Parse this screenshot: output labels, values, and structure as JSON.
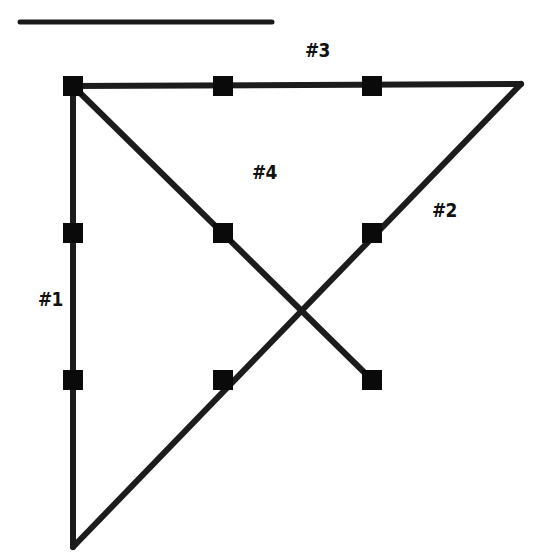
{
  "diagram": {
    "type": "nine-dot-puzzle-solution",
    "header": {
      "partial_title_visible": true,
      "rule": {
        "x1": 20,
        "y1": 22,
        "x2": 272,
        "y2": 22,
        "color": "#1a1a1a",
        "width": 5
      }
    },
    "dot_color": "#0a0a0a",
    "dot_size": 20,
    "line_color": "#1c1c1c",
    "line_width": 6,
    "dots": [
      {
        "id": "r1c1",
        "x": 73,
        "y": 86
      },
      {
        "id": "r1c2",
        "x": 223,
        "y": 86
      },
      {
        "id": "r1c3",
        "x": 372,
        "y": 86
      },
      {
        "id": "r2c1",
        "x": 73,
        "y": 233
      },
      {
        "id": "r2c2",
        "x": 223,
        "y": 233
      },
      {
        "id": "r2c3",
        "x": 372,
        "y": 233
      },
      {
        "id": "r3c1",
        "x": 73,
        "y": 380
      },
      {
        "id": "r3c2",
        "x": 223,
        "y": 380
      },
      {
        "id": "r3c3",
        "x": 372,
        "y": 380
      }
    ],
    "lines": [
      {
        "id": "line-1",
        "label": "#1",
        "x1": 73,
        "y1": 86,
        "x2": 73,
        "y2": 547
      },
      {
        "id": "line-2",
        "label": "#2",
        "x1": 73,
        "y1": 547,
        "x2": 521,
        "y2": 84
      },
      {
        "id": "line-3",
        "label": "#3",
        "x1": 521,
        "y1": 84,
        "x2": 73,
        "y2": 86
      },
      {
        "id": "line-4",
        "label": "#4",
        "x1": 73,
        "y1": 86,
        "x2": 372,
        "y2": 380
      }
    ],
    "labels": [
      {
        "id": "label-1",
        "text": "#1",
        "x": 38,
        "y": 287
      },
      {
        "id": "label-2",
        "text": "#2",
        "x": 432,
        "y": 198
      },
      {
        "id": "label-3",
        "text": "#3",
        "x": 305,
        "y": 38
      },
      {
        "id": "label-4",
        "text": "#4",
        "x": 252,
        "y": 160
      }
    ]
  }
}
